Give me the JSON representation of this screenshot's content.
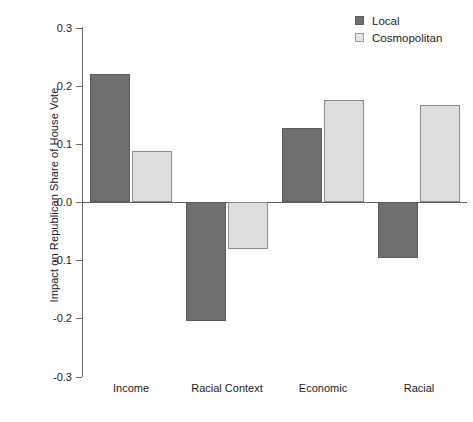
{
  "chart_data": {
    "type": "bar",
    "title": "",
    "xlabel": "",
    "ylabel": "Impact on Republican Share of House Vote",
    "ylim": [
      -0.3,
      0.3
    ],
    "ytick_labels": [
      "0.3",
      "0.2",
      "0.1",
      "0.0",
      "-0.1",
      "-0.2",
      "-0.3"
    ],
    "ytick_values": [
      0.3,
      0.2,
      0.1,
      0.0,
      -0.1,
      -0.2,
      -0.3
    ],
    "grid": false,
    "legend_position": "top-right",
    "categories": [
      "Income",
      "Racial Context",
      "Economic",
      "Racial"
    ],
    "series": [
      {
        "name": "Local",
        "color": "#6f6f6f",
        "values": [
          0.22,
          -0.205,
          0.128,
          -0.096
        ]
      },
      {
        "name": "Cosmopolitan",
        "color": "#dedede",
        "values": [
          0.088,
          -0.08,
          0.176,
          0.167
        ]
      }
    ]
  },
  "legend": {
    "items": [
      {
        "label": "Local",
        "swatch": "local-swatch-icon"
      },
      {
        "label": "Cosmopolitan",
        "swatch": "cosmopolitan-swatch-icon"
      }
    ]
  }
}
